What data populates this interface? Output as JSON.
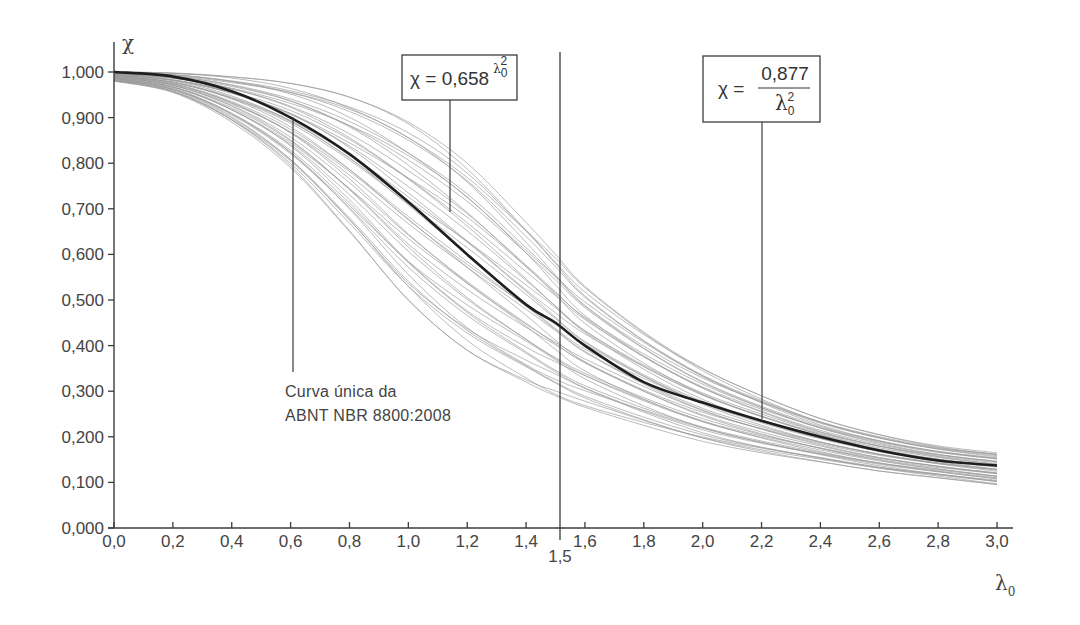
{
  "chart_data": {
    "type": "line",
    "title": "",
    "xlabel": "λ0",
    "ylabel": "χ",
    "xlim": [
      0.0,
      3.0
    ],
    "ylim": [
      0.0,
      1.0
    ],
    "grid": false,
    "x_ticks": [
      "0,0",
      "0,2",
      "0,4",
      "0,6",
      "0,8",
      "1,0",
      "1,2",
      "1,4",
      "1,6",
      "1,8",
      "2,0",
      "2,2",
      "2,4",
      "2,6",
      "2,8",
      "3,0"
    ],
    "x_tick_values": [
      0.0,
      0.2,
      0.4,
      0.6,
      0.8,
      1.0,
      1.2,
      1.4,
      1.6,
      1.8,
      2.0,
      2.2,
      2.4,
      2.6,
      2.8,
      3.0
    ],
    "y_ticks": [
      "0,000",
      "0,100",
      "0,200",
      "0,300",
      "0,400",
      "0,500",
      "0,600",
      "0,700",
      "0,800",
      "0,900",
      "1,000"
    ],
    "y_tick_values": [
      0.0,
      0.1,
      0.2,
      0.3,
      0.4,
      0.5,
      0.6,
      0.7,
      0.8,
      0.9,
      1.0
    ],
    "reference_line": {
      "x": 1.5,
      "label": "1,5"
    },
    "series": [
      {
        "name": "Curva única da ABNT NBR 8800:2008",
        "style": "bold",
        "x": [
          0.0,
          0.2,
          0.4,
          0.6,
          0.8,
          1.0,
          1.2,
          1.4,
          1.5,
          1.6,
          1.8,
          2.0,
          2.2,
          2.4,
          2.6,
          2.8,
          3.0
        ],
        "values": [
          1.0,
          0.99,
          0.958,
          0.9,
          0.82,
          0.715,
          0.6,
          0.49,
          0.45,
          0.4,
          0.32,
          0.275,
          0.235,
          0.2,
          0.17,
          0.148,
          0.137
        ]
      },
      {
        "name": "Upper envelope of test curves",
        "style": "thin-gray",
        "x": [
          0.0,
          0.2,
          0.4,
          0.6,
          0.8,
          1.0,
          1.2,
          1.4,
          1.5,
          1.6,
          1.8,
          2.0,
          2.2,
          2.4,
          2.6,
          2.8,
          3.0
        ],
        "values": [
          1.0,
          0.998,
          0.99,
          0.975,
          0.945,
          0.89,
          0.8,
          0.67,
          0.6,
          0.53,
          0.43,
          0.35,
          0.29,
          0.24,
          0.205,
          0.18,
          0.165
        ]
      },
      {
        "name": "Lower envelope of test curves",
        "style": "thin-gray",
        "x": [
          0.0,
          0.2,
          0.4,
          0.6,
          0.8,
          1.0,
          1.2,
          1.4,
          1.5,
          1.6,
          1.8,
          2.0,
          2.2,
          2.4,
          2.6,
          2.8,
          3.0
        ],
        "values": [
          0.98,
          0.955,
          0.89,
          0.79,
          0.65,
          0.5,
          0.39,
          0.32,
          0.29,
          0.265,
          0.225,
          0.19,
          0.165,
          0.145,
          0.125,
          0.11,
          0.095
        ]
      }
    ],
    "band_curve_count": 42,
    "annotations": [
      {
        "id": "eq1",
        "text_left": "χ = 0,658",
        "exponent_base": "λ",
        "exponent_sub": "0",
        "exponent_sup": "2",
        "points_to_x": 1.13
      },
      {
        "id": "eq2",
        "text_left": "χ =",
        "numerator": "0,877",
        "denominator_base": "λ",
        "denominator_sub": "0",
        "denominator_sup": "2",
        "points_to_x": 2.16
      },
      {
        "id": "curve-label",
        "line1": "Curva única da",
        "line2": "ABNT NBR 8800:2008",
        "points_to_x": 0.6
      }
    ]
  },
  "labels": {
    "y_axis_title": "χ",
    "x_axis_title_base": "λ",
    "x_axis_title_sub": "0",
    "ref_label": "1,5",
    "eq1_left": "χ = 0,658",
    "eq1_base": "λ",
    "eq1_sub": "0",
    "eq1_sup": "2",
    "eq2_left": "χ =",
    "eq2_num": "0,877",
    "eq2_den_base": "λ",
    "eq2_den_sub": "0",
    "eq2_den_sup": "2",
    "curve_label_1": "Curva única da",
    "curve_label_2": "ABNT NBR 8800:2008"
  },
  "colors": {
    "axis": "#3c3c3c",
    "main_curve": "#1e1e1e",
    "band_curves": "#9a9a9a",
    "text": "#444444"
  }
}
